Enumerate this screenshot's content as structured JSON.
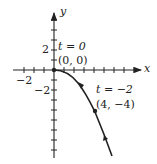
{
  "figure": {
    "type": "parametric-curve",
    "axes": {
      "x_label": "x",
      "y_label": "y",
      "x_tick_labels": [
        {
          "value": -2,
          "text": "−2"
        }
      ],
      "y_tick_labels": [
        {
          "value": 2,
          "text": "2"
        },
        {
          "value": -2,
          "text": "−2"
        }
      ],
      "x_range": [
        -4,
        8
      ],
      "y_range": [
        -9,
        5.5
      ],
      "unit_px": 10
    },
    "points": [
      {
        "id": "origin",
        "t_label": "t = 0",
        "coord_label": "(0, 0)",
        "x": 0,
        "y": 0
      },
      {
        "id": "t-neg2",
        "t_label": "t = −2",
        "coord_label": "(4, −4)",
        "x": 4,
        "y": -4
      }
    ],
    "curve_color": "#222222",
    "axis_color": "#222222"
  }
}
